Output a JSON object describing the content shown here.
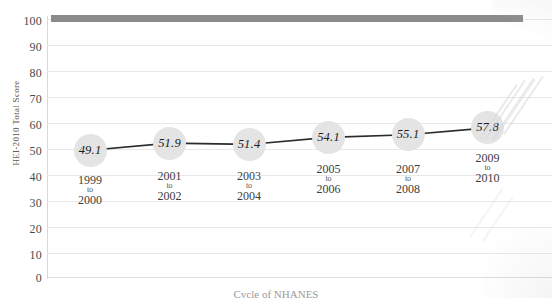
{
  "chart_data": {
    "type": "line",
    "title": "",
    "xlabel": "Cycle of NHANES",
    "ylabel": "HEI-2010 Total Score",
    "ylim": [
      0,
      100
    ],
    "ytick_step": 10,
    "yticks": [
      "100",
      "90",
      "80",
      "70",
      "60",
      "50",
      "40",
      "30",
      "20",
      "10",
      "0"
    ],
    "grid": true,
    "legend": "none",
    "categories": [
      {
        "start": "1999",
        "sep": "to",
        "end": "2000"
      },
      {
        "start": "2001",
        "sep": "to",
        "end": "2002"
      },
      {
        "start": "2003",
        "sep": "to",
        "end": "2004"
      },
      {
        "start": "2005",
        "sep": "to",
        "end": "2006"
      },
      {
        "start": "2007",
        "sep": "to",
        "end": "2008"
      },
      {
        "start": "2009",
        "sep": "to",
        "end": "2010"
      }
    ],
    "values": [
      49.1,
      51.9,
      51.4,
      54.1,
      55.1,
      57.8
    ],
    "point_labels": [
      "49.1",
      "51.9",
      "51.4",
      "54.1",
      "55.1",
      "57.8"
    ],
    "marker": "circle-bubble",
    "colors": {
      "bubble_fill": "#e4e4e4",
      "line": "#2b2b2b",
      "gridline": "#e8e8e8",
      "axis": "#d9d9d9",
      "top_bar": "#8a8a8a",
      "label_text": "#1d1d1d"
    }
  },
  "decorations": {
    "top_bar_value": "100",
    "bottom_caption": "Cycle of NHANES"
  }
}
